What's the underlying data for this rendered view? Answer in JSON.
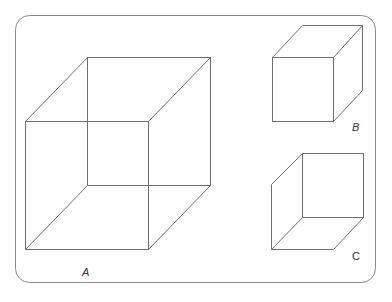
{
  "figure": {
    "frame_color": "#8a8a8a",
    "line_color": "#6e6e6e",
    "cubes": [
      {
        "id": "A",
        "label": "A",
        "front": [
          25,
          121,
          148,
          249
        ],
        "back": [
          87,
          57,
          210,
          185
        ],
        "label_pos": [
          82,
          276
        ]
      },
      {
        "id": "B",
        "label": "B",
        "front": [
          272,
          57,
          333,
          121
        ],
        "back": [
          302,
          25,
          362,
          90
        ],
        "label_pos": [
          352,
          131
        ]
      },
      {
        "id": "C",
        "label": "C",
        "front": [
          271,
          184,
          333,
          249
        ],
        "back": [
          302,
          153,
          363,
          217
        ],
        "label_pos": [
          352,
          260
        ]
      }
    ]
  }
}
